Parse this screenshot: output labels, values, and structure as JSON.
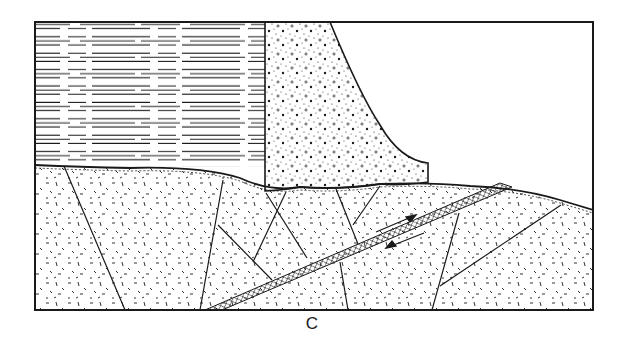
{
  "figure": {
    "label": "C",
    "colors": {
      "ink": "#1a1a1a",
      "background": "#ffffff"
    },
    "regions": [
      {
        "name": "reservoir-water",
        "pattern": "horizontal-dashes"
      },
      {
        "name": "concrete-dam",
        "pattern": "stipple-dots"
      },
      {
        "name": "bedrock",
        "pattern": "random-dashes"
      },
      {
        "name": "fault-zone",
        "pattern": "cross-hatched-band",
        "annotation": "shear arrows (opposing)"
      }
    ]
  }
}
